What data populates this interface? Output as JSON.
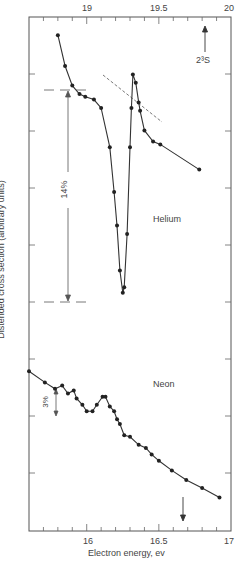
{
  "chart_data": [
    {
      "type": "line",
      "title": "Helium",
      "panel": "upper",
      "xaxis": {
        "position": "top",
        "label": "Electron energy, ev",
        "range": [
          18.6,
          20.0
        ],
        "ticks": [
          19,
          19.5,
          20
        ],
        "tick_labels": [
          "19",
          "19.5",
          "20"
        ],
        "minor_step": 0.1
      },
      "ylabel": "Distended cross section (arbitrary units)",
      "annotations": [
        {
          "text": "2³S",
          "type": "arrow-up",
          "x": 19.82
        },
        {
          "text": "14%",
          "type": "double-arrow-scale"
        }
      ],
      "series": [
        {
          "name": "Helium",
          "x": [
            18.8,
            18.85,
            18.9,
            18.95,
            18.99,
            19.05,
            19.1,
            19.16,
            19.19,
            19.21,
            19.23,
            19.25,
            19.26,
            19.28,
            19.3,
            19.31,
            19.32,
            19.34,
            19.36,
            19.37,
            19.4,
            19.46,
            19.51,
            19.78
          ],
          "y": [
            0.96,
            0.85,
            0.78,
            0.75,
            0.74,
            0.73,
            0.7,
            0.56,
            0.4,
            0.28,
            0.12,
            0.04,
            0.06,
            0.25,
            0.56,
            0.7,
            0.82,
            0.79,
            0.72,
            0.69,
            0.62,
            0.58,
            0.57,
            0.48
          ]
        },
        {
          "name": "Background (dashed)",
          "x": [
            19.1,
            19.52
          ],
          "y": [
            0.7,
            0.57
          ]
        }
      ]
    },
    {
      "type": "line",
      "title": "Neon",
      "panel": "lower",
      "xaxis": {
        "position": "bottom",
        "label": "Electron energy, ev",
        "range": [
          15.6,
          17.0
        ],
        "ticks": [
          16,
          16.5,
          17
        ],
        "tick_labels": [
          "16",
          "16.5",
          "17"
        ],
        "minor_step": 0.1
      },
      "annotations": [
        {
          "text": "3%",
          "type": "double-arrow-scale"
        },
        {
          "text": "",
          "type": "arrow-down",
          "x": 16.66
        }
      ],
      "series": [
        {
          "name": "Neon",
          "x": [
            15.6,
            15.71,
            15.78,
            15.83,
            15.87,
            15.91,
            15.93,
            15.97,
            16.0,
            16.04,
            16.07,
            16.11,
            16.13,
            16.16,
            16.19,
            16.21,
            16.23,
            16.26,
            16.3,
            16.36,
            16.41,
            16.45,
            16.5,
            16.59,
            16.69,
            16.8,
            16.92
          ],
          "y": [
            0.93,
            0.86,
            0.82,
            0.84,
            0.79,
            0.81,
            0.76,
            0.72,
            0.68,
            0.68,
            0.72,
            0.77,
            0.77,
            0.71,
            0.68,
            0.63,
            0.6,
            0.53,
            0.52,
            0.47,
            0.45,
            0.41,
            0.37,
            0.31,
            0.25,
            0.2,
            0.14
          ]
        }
      ]
    }
  ],
  "labels": {
    "ylabel": "Distended cross section (arbitrary units)",
    "xlabel": "Electron energy, ev",
    "helium": "Helium",
    "neon": "Neon",
    "state": "2³S",
    "scale_he": "14%",
    "scale_ne": "3%",
    "top_ticks": [
      "19",
      "19.5",
      "20"
    ],
    "bottom_ticks": [
      "16",
      "16.5",
      "17"
    ]
  }
}
